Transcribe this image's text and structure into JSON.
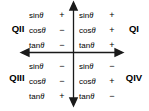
{
  "diagram": {
    "axis_color": "#1a1a1a",
    "text_color": "#000000",
    "background": "#ffffff",
    "quadrants": [
      {
        "id": "qi",
        "label": "QI",
        "position": "upper-right",
        "rows": [
          {
            "function": "sin",
            "variable": "θ",
            "sign": "+"
          },
          {
            "function": "cos",
            "variable": "θ",
            "sign": "+"
          },
          {
            "function": "tan",
            "variable": "θ",
            "sign": "+"
          }
        ]
      },
      {
        "id": "qii",
        "label": "QII",
        "position": "upper-left",
        "rows": [
          {
            "function": "sin",
            "variable": "θ",
            "sign": "+"
          },
          {
            "function": "cos",
            "variable": "θ",
            "sign": "−"
          },
          {
            "function": "tan",
            "variable": "θ",
            "sign": "−"
          }
        ]
      },
      {
        "id": "qiii",
        "label": "QIII",
        "position": "lower-left",
        "rows": [
          {
            "function": "sin",
            "variable": "θ",
            "sign": "−"
          },
          {
            "function": "cos",
            "variable": "θ",
            "sign": "−"
          },
          {
            "function": "tan",
            "variable": "θ",
            "sign": "+"
          }
        ]
      },
      {
        "id": "qiv",
        "label": "QIV",
        "position": "lower-right",
        "rows": [
          {
            "function": "sin",
            "variable": "θ",
            "sign": "−"
          },
          {
            "function": "cos",
            "variable": "θ",
            "sign": "+"
          },
          {
            "function": "tan",
            "variable": "θ",
            "sign": "−"
          }
        ]
      }
    ]
  }
}
